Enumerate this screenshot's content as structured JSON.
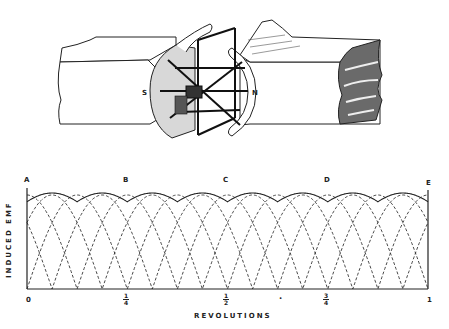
{
  "figure": {
    "illustration": {
      "description": "Generator: horseshoe magnet poles with rotating armature coils",
      "pole_left": "S",
      "pole_right": "N"
    }
  },
  "chart_data": {
    "type": "line",
    "title": "",
    "xlabel": "REVOLUTIONS",
    "ylabel": "INDUCED EMF",
    "x_ticks": [
      "0",
      "1/4",
      "1/2",
      "3/4",
      "1"
    ],
    "x_tick_positions": [
      0,
      0.25,
      0.5,
      0.75,
      1.0
    ],
    "top_labels": [
      "A",
      "B",
      "C",
      "D",
      "E"
    ],
    "top_label_positions": [
      0,
      0.25,
      0.5,
      0.75,
      1.0
    ],
    "xlim": [
      0,
      1
    ],
    "ylim": [
      0,
      1
    ],
    "grid": false,
    "series": [
      {
        "name": "coil EMF (rectified sine, dashed)",
        "style": "dashed",
        "period_rev": 0.25,
        "phases_rev": [
          0,
          0.0625,
          0.125,
          0.1875
        ]
      },
      {
        "name": "resultant EMF envelope (solid)",
        "style": "solid",
        "description": "maximum of overlapping coil EMFs; ripples near peak value"
      }
    ],
    "annotations": [
      "dot marker near x=0.625 below axis"
    ]
  },
  "axis": {
    "tick_0": "0",
    "tick_1": "1",
    "tick_q_num": "1",
    "tick_q_den": "4",
    "tick_h_num": "1",
    "tick_h_den": "2",
    "tick_3q_num": "3",
    "tick_3q_den": "4",
    "xlabel": "REVOLUTIONS",
    "ylabel": "INDUCED EMF",
    "labels": {
      "A": "A",
      "B": "B",
      "C": "C",
      "D": "D",
      "E": "E"
    },
    "dot": "•"
  },
  "poles": {
    "s": "S",
    "n": "N"
  }
}
